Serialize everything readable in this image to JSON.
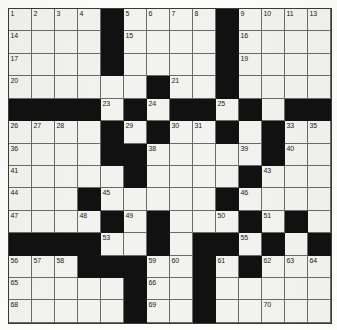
{
  "puzzle": {
    "kind": "crossword-grid",
    "columns": 14,
    "rows": 14,
    "colors": {
      "block": "#111111",
      "cell": "#f2f2ee",
      "grid_line": "#6b6b6b",
      "border": "#3a3a3a",
      "number_text": "#1a1a1a"
    },
    "legend": {
      "block_symbol": "#",
      "open_symbol": "."
    },
    "rows_layout": [
      "....#....#....",
      "....#....#....",
      "....#....#....",
      "......#..#....",
      "####.#.##.#.##",
      "....#.#..#.#..",
      "....##.....#..",
      ".....#....#...",
      "...#.....#....",
      "....#.#...#.#.",
      "####..#.##.#.#",
      "...###..#.#...",
      ".....#..#.....",
      ".....#..#....."
    ],
    "numbers": [
      {
        "row": 0,
        "col": 0,
        "n": "1"
      },
      {
        "row": 0,
        "col": 1,
        "n": "2"
      },
      {
        "row": 0,
        "col": 2,
        "n": "3"
      },
      {
        "row": 0,
        "col": 3,
        "n": "4"
      },
      {
        "row": 0,
        "col": 5,
        "n": "5"
      },
      {
        "row": 0,
        "col": 6,
        "n": "6"
      },
      {
        "row": 0,
        "col": 7,
        "n": "7"
      },
      {
        "row": 0,
        "col": 8,
        "n": "8"
      },
      {
        "row": 0,
        "col": 10,
        "n": "9"
      },
      {
        "row": 0,
        "col": 11,
        "n": "10"
      },
      {
        "row": 0,
        "col": 12,
        "n": "11"
      },
      {
        "row": 0,
        "col": 13,
        "n": "12"
      },
      {
        "row": 1,
        "col": 0,
        "n": "14"
      },
      {
        "row": 1,
        "col": 5,
        "n": "15"
      },
      {
        "row": 1,
        "col": 10,
        "n": "16"
      },
      {
        "row": 2,
        "col": 0,
        "n": "17"
      },
      {
        "row": 2,
        "col": 4,
        "n": "18"
      },
      {
        "row": 2,
        "col": 10,
        "n": "19"
      },
      {
        "row": 3,
        "col": 0,
        "n": "20"
      },
      {
        "row": 3,
        "col": 7,
        "n": "21"
      },
      {
        "row": 3,
        "col": 9,
        "n": "22"
      },
      {
        "row": 4,
        "col": 4,
        "n": "23"
      },
      {
        "row": 4,
        "col": 6,
        "n": "24"
      },
      {
        "row": 4,
        "col": 9,
        "n": "25"
      },
      {
        "row": 5,
        "col": 0,
        "n": "26"
      },
      {
        "row": 5,
        "col": 1,
        "n": "27"
      },
      {
        "row": 5,
        "col": 2,
        "n": "28"
      },
      {
        "row": 5,
        "col": 5,
        "n": "29"
      },
      {
        "row": 5,
        "col": 7,
        "n": "30"
      },
      {
        "row": 5,
        "col": 8,
        "n": "31"
      },
      {
        "row": 5,
        "col": 11,
        "n": "32"
      },
      {
        "row": 5,
        "col": 12,
        "n": "33"
      },
      {
        "row": 5,
        "col": 13,
        "n": "34"
      },
      {
        "row": 6,
        "col": 0,
        "n": "36"
      },
      {
        "row": 6,
        "col": 4,
        "n": "37"
      },
      {
        "row": 6,
        "col": 6,
        "n": "38"
      },
      {
        "row": 6,
        "col": 10,
        "n": "39"
      },
      {
        "row": 6,
        "col": 12,
        "n": "40"
      },
      {
        "row": 7,
        "col": 0,
        "n": "41"
      },
      {
        "row": 7,
        "col": 5,
        "n": "42"
      },
      {
        "row": 7,
        "col": 11,
        "n": "43"
      },
      {
        "row": 8,
        "col": 0,
        "n": "44"
      },
      {
        "row": 8,
        "col": 4,
        "n": "45"
      },
      {
        "row": 8,
        "col": 10,
        "n": "46"
      },
      {
        "row": 9,
        "col": 0,
        "n": "47"
      },
      {
        "row": 9,
        "col": 3,
        "n": "48"
      },
      {
        "row": 9,
        "col": 5,
        "n": "49"
      },
      {
        "row": 9,
        "col": 9,
        "n": "50"
      },
      {
        "row": 9,
        "col": 11,
        "n": "51"
      },
      {
        "row": 10,
        "col": 3,
        "n": "52"
      },
      {
        "row": 10,
        "col": 4,
        "n": "53"
      },
      {
        "row": 10,
        "col": 8,
        "n": "54"
      },
      {
        "row": 10,
        "col": 10,
        "n": "55"
      },
      {
        "row": 11,
        "col": 0,
        "n": "56"
      },
      {
        "row": 11,
        "col": 1,
        "n": "57"
      },
      {
        "row": 11,
        "col": 2,
        "n": "58"
      },
      {
        "row": 11,
        "col": 6,
        "n": "59"
      },
      {
        "row": 11,
        "col": 7,
        "n": "60"
      },
      {
        "row": 11,
        "col": 9,
        "n": "61"
      },
      {
        "row": 11,
        "col": 11,
        "n": "62"
      },
      {
        "row": 11,
        "col": 12,
        "n": "63"
      },
      {
        "row": 11,
        "col": 13,
        "n": "64"
      },
      {
        "row": 12,
        "col": 0,
        "n": "65"
      },
      {
        "row": 12,
        "col": 6,
        "n": "66"
      },
      {
        "row": 12,
        "col": 8,
        "n": "67"
      },
      {
        "row": 13,
        "col": 0,
        "n": "68"
      },
      {
        "row": 13,
        "col": 6,
        "n": "69"
      },
      {
        "row": 13,
        "col": 11,
        "n": "70"
      }
    ],
    "extra_numbers_row14": [
      {
        "row": 14,
        "col": 0,
        "n": "71"
      },
      {
        "row": 14,
        "col": 6,
        "n": "72"
      },
      {
        "row": 14,
        "col": 11,
        "n": "73"
      }
    ],
    "numbers_row0_last": {
      "row": 0,
      "col": 13,
      "n": "13"
    },
    "numbers_row5_last": {
      "row": 5,
      "col": 13,
      "n": "35"
    }
  }
}
